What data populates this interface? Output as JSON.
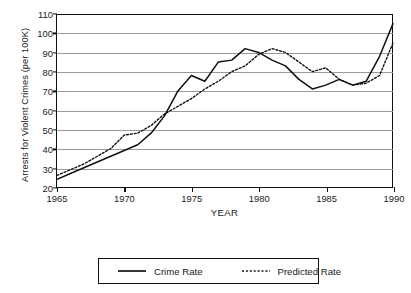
{
  "chart_data": {
    "type": "line",
    "title": "",
    "xlabel": "YEAR",
    "ylabel": "Arrests for Violent Crimes (per 100K)",
    "xlim": [
      1965,
      1990
    ],
    "ylim": [
      20,
      110
    ],
    "xticks": [
      1965,
      1970,
      1975,
      1980,
      1985,
      1990
    ],
    "yticks": [
      20,
      30,
      40,
      50,
      60,
      70,
      80,
      90,
      100,
      110
    ],
    "grid": "horizontal",
    "legend_position": "below-center",
    "x": [
      1965,
      1966,
      1967,
      1968,
      1969,
      1970,
      1971,
      1972,
      1973,
      1974,
      1975,
      1976,
      1977,
      1978,
      1979,
      1980,
      1981,
      1982,
      1983,
      1984,
      1985,
      1986,
      1987,
      1988,
      1989,
      1990
    ],
    "series": [
      {
        "name": "Crime Rate",
        "style": "solid",
        "color": "#111111",
        "values": [
          24,
          27,
          30,
          33,
          36,
          39,
          42,
          48,
          57,
          70,
          78,
          75,
          85,
          86,
          92,
          90,
          86,
          83,
          76,
          71,
          73,
          76,
          73,
          75,
          88,
          105
        ]
      },
      {
        "name": "Predicted Rate",
        "style": "dotted",
        "color": "#111111",
        "values": [
          26,
          29,
          32,
          36,
          40,
          47,
          48,
          52,
          58,
          62,
          66,
          71,
          75,
          80,
          83,
          89,
          92,
          90,
          85,
          80,
          82,
          76,
          73,
          74,
          78,
          95
        ]
      }
    ]
  },
  "legend": {
    "entries": [
      {
        "label": "Crime Rate"
      },
      {
        "label": "Predicted Rate"
      }
    ]
  }
}
